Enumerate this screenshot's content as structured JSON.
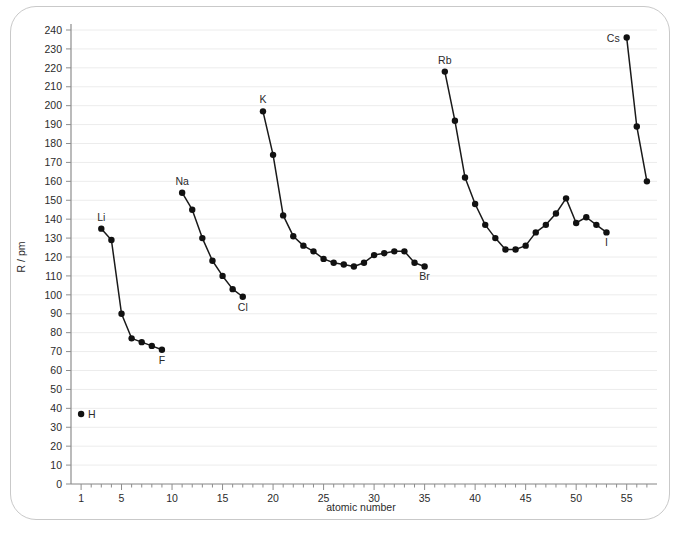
{
  "figure": {
    "border_color": "#c9c9c9",
    "background": "#ffffff"
  },
  "axes": {
    "x_title": "atomic number",
    "y_title": "R / pm",
    "x_major_ticks": [
      "1",
      "5",
      "10",
      "15",
      "20",
      "25",
      "30",
      "35",
      "40",
      "45",
      "50",
      "55"
    ],
    "y_major_ticks": [
      "0",
      "10",
      "20",
      "30",
      "40",
      "50",
      "60",
      "70",
      "80",
      "90",
      "100",
      "110",
      "120",
      "130",
      "140",
      "150",
      "160",
      "170",
      "180",
      "190",
      "200",
      "210",
      "220",
      "230",
      "240"
    ]
  },
  "chart_data": {
    "type": "line",
    "title": "",
    "xlabel": "atomic number",
    "ylabel": "R / pm",
    "xlim": [
      0,
      58
    ],
    "ylim": [
      0,
      240
    ],
    "grid": true,
    "legend": "none",
    "marker": "filled-circle",
    "line_color": "#1a1a1a",
    "annotations": [
      {
        "text": "H",
        "x": 1,
        "y": 37,
        "anchor": "right"
      },
      {
        "text": "Li",
        "x": 3,
        "y": 135,
        "anchor": "above"
      },
      {
        "text": "F",
        "x": 9,
        "y": 71,
        "anchor": "below"
      },
      {
        "text": "Na",
        "x": 11,
        "y": 154,
        "anchor": "above"
      },
      {
        "text": "Cl",
        "x": 17,
        "y": 99,
        "anchor": "below"
      },
      {
        "text": "K",
        "x": 19,
        "y": 197,
        "anchor": "above"
      },
      {
        "text": "Br",
        "x": 35,
        "y": 115,
        "anchor": "below"
      },
      {
        "text": "Rb",
        "x": 37,
        "y": 218,
        "anchor": "above"
      },
      {
        "text": "I",
        "x": 53,
        "y": 133,
        "anchor": "below"
      },
      {
        "text": "Cs",
        "x": 55,
        "y": 236,
        "anchor": "left"
      }
    ],
    "series": [
      {
        "name": "period-1",
        "x": [
          1
        ],
        "values": [
          37
        ]
      },
      {
        "name": "period-2",
        "x": [
          3,
          4,
          5,
          6,
          7,
          8,
          9
        ],
        "values": [
          135,
          129,
          90,
          77,
          75,
          73,
          71
        ]
      },
      {
        "name": "period-3",
        "x": [
          11,
          12,
          13,
          14,
          15,
          16,
          17
        ],
        "values": [
          154,
          145,
          130,
          118,
          110,
          103,
          99
        ]
      },
      {
        "name": "period-4",
        "x": [
          19,
          20,
          21,
          22,
          23,
          24,
          25,
          26,
          27,
          28,
          29,
          30,
          31,
          32,
          33,
          34,
          35
        ],
        "values": [
          197,
          174,
          142,
          131,
          126,
          123,
          119,
          117,
          116,
          115,
          117,
          121,
          122,
          123,
          123,
          117,
          115
        ]
      },
      {
        "name": "period-5",
        "x": [
          37,
          38,
          39,
          40,
          41,
          42,
          43,
          44,
          45,
          46,
          47,
          48,
          49,
          50,
          51,
          52,
          53
        ],
        "values": [
          218,
          192,
          162,
          148,
          137,
          130,
          124,
          124,
          126,
          133,
          137,
          143,
          151,
          138,
          141,
          137,
          133
        ]
      },
      {
        "name": "period-6",
        "x": [
          55,
          56,
          57
        ],
        "values": [
          236,
          189,
          160
        ]
      }
    ]
  }
}
